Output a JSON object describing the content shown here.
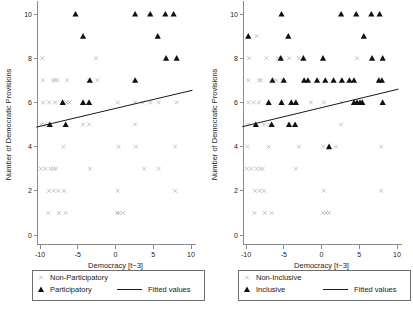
{
  "figure": {
    "background": "#ffffff",
    "width": 413,
    "height": 310,
    "marker_colors": {
      "non_highlight": "#b9b9b9",
      "highlight": "#111111",
      "fit_line": "#1a1a1a",
      "axis": "#8a8a8a"
    }
  },
  "chart_data": [
    {
      "type": "scatter",
      "panel": "left",
      "title": "",
      "xlabel": "Democracy [t−3]",
      "ylabel": "Number of Democratic Provisions",
      "xlim": [
        -11,
        11
      ],
      "ylim": [
        -0.4,
        10.6
      ],
      "xticks": [
        -10,
        -5,
        0,
        5,
        10
      ],
      "xticklabels": [
        "-10",
        "-5",
        "0",
        "5",
        "10"
      ],
      "yticks": [
        0,
        2,
        4,
        6,
        8,
        10
      ],
      "yticklabels": [
        "0",
        "2",
        "4",
        "6",
        "8",
        "10"
      ],
      "grid": false,
      "legend_position": "below-axis",
      "legend": [
        {
          "label": "Non-Participatory",
          "marker": "x",
          "color": "#b9b9b9"
        },
        {
          "label": "Participatory",
          "marker": "triangle",
          "color": "#111111"
        },
        {
          "label": "Fitted values",
          "marker": "line",
          "color": "#1a1a1a"
        }
      ],
      "fitted_line": {
        "x": [
          -10.5,
          10.2
        ],
        "y": [
          4.88,
          6.55
        ]
      },
      "series": [
        {
          "name": "Non-Participatory",
          "marker": "x",
          "color": "#b9b9b9",
          "points": [
            [
              -9.6,
              7
            ],
            [
              -8.3,
              7
            ],
            [
              -8.0,
              7
            ],
            [
              -7.7,
              7
            ],
            [
              -6.4,
              7
            ],
            [
              -3.5,
              7
            ],
            [
              -2.4,
              7
            ],
            [
              -9.6,
              6
            ],
            [
              -8.8,
              6
            ],
            [
              -8.0,
              6
            ],
            [
              -7.0,
              6
            ],
            [
              -6.5,
              6
            ],
            [
              -6.1,
              6
            ],
            [
              0.3,
              6
            ],
            [
              2.6,
              6
            ],
            [
              3.6,
              6
            ],
            [
              4.6,
              6
            ],
            [
              5.7,
              6
            ],
            [
              8.1,
              6
            ],
            [
              -9.8,
              5
            ],
            [
              -9.4,
              5
            ],
            [
              -4.3,
              5
            ],
            [
              -3.5,
              5
            ],
            [
              2.6,
              5
            ],
            [
              -6.9,
              4
            ],
            [
              0.4,
              4
            ],
            [
              2.7,
              4
            ],
            [
              7.9,
              4
            ],
            [
              -9.9,
              3
            ],
            [
              -9.3,
              3
            ],
            [
              -8.6,
              3
            ],
            [
              -8.2,
              3
            ],
            [
              -7.9,
              3
            ],
            [
              -3.4,
              3
            ],
            [
              3.8,
              3
            ],
            [
              5.7,
              3
            ],
            [
              -8.8,
              2
            ],
            [
              -8.2,
              2
            ],
            [
              -7.6,
              2
            ],
            [
              -6.8,
              2
            ],
            [
              0.3,
              2
            ],
            [
              7.9,
              2
            ],
            [
              -8.9,
              1
            ],
            [
              -7.5,
              1
            ],
            [
              -6.6,
              1
            ],
            [
              0.2,
              1
            ],
            [
              0.5,
              1
            ],
            [
              1.0,
              1
            ],
            [
              -2.6,
              8
            ],
            [
              -9.7,
              8
            ]
          ]
        },
        {
          "name": "Participatory",
          "marker": "triangle",
          "color": "#111111",
          "points": [
            [
              -5.3,
              10
            ],
            [
              2.6,
              10
            ],
            [
              4.6,
              10
            ],
            [
              6.6,
              10
            ],
            [
              7.7,
              10
            ],
            [
              -4.3,
              9
            ],
            [
              5.6,
              9
            ],
            [
              6.7,
              8
            ],
            [
              8.1,
              8
            ],
            [
              -3.4,
              7
            ],
            [
              2.6,
              7
            ],
            [
              -7.0,
              6
            ],
            [
              -4.3,
              6
            ],
            [
              -3.5,
              6
            ],
            [
              -8.7,
              5
            ],
            [
              -6.6,
              5
            ]
          ]
        }
      ]
    },
    {
      "type": "scatter",
      "panel": "right",
      "title": "",
      "xlabel": "Democracy [t−3]",
      "ylabel": "Number of Democratic Provisions",
      "xlim": [
        -11,
        11
      ],
      "ylim": [
        -0.4,
        10.6
      ],
      "xticks": [
        -10,
        -5,
        0,
        5,
        10
      ],
      "xticklabels": [
        "-10",
        "-5",
        "0",
        "5",
        "10"
      ],
      "yticks": [
        0,
        2,
        4,
        6,
        8,
        10
      ],
      "yticklabels": [
        "0",
        "2",
        "4",
        "6",
        "8",
        "10"
      ],
      "grid": false,
      "legend_position": "below-axis",
      "legend": [
        {
          "label": "Non-Inclusive",
          "marker": "x",
          "color": "#b9b9b9"
        },
        {
          "label": "Inclusive",
          "marker": "triangle",
          "color": "#111111"
        },
        {
          "label": "Fitted values",
          "marker": "line",
          "color": "#1a1a1a"
        }
      ],
      "fitted_line": {
        "x": [
          -10.5,
          10.2
        ],
        "y": [
          4.9,
          6.6
        ]
      },
      "series": [
        {
          "name": "Non-Inclusive",
          "marker": "x",
          "color": "#b9b9b9",
          "points": [
            [
              -8.6,
              9
            ],
            [
              -9.6,
              8
            ],
            [
              -7.3,
              8
            ],
            [
              -5.8,
              8
            ],
            [
              -5.4,
              8
            ],
            [
              -4.3,
              8
            ],
            [
              -3.0,
              8
            ],
            [
              4.7,
              8
            ],
            [
              -9.7,
              7
            ],
            [
              -8.3,
              7
            ],
            [
              -8.0,
              7
            ],
            [
              -6.0,
              7
            ],
            [
              -5.2,
              7
            ],
            [
              -0.4,
              7
            ],
            [
              -9.7,
              6
            ],
            [
              -9.0,
              6
            ],
            [
              -8.3,
              6
            ],
            [
              -5.2,
              6
            ],
            [
              -1.4,
              6
            ],
            [
              0.3,
              6
            ],
            [
              2.6,
              6
            ],
            [
              4.7,
              6
            ],
            [
              -9.7,
              5
            ],
            [
              -7.6,
              5
            ],
            [
              -6.9,
              5
            ],
            [
              -4.3,
              5
            ],
            [
              2.6,
              5
            ],
            [
              -9.8,
              4
            ],
            [
              -7.0,
              4
            ],
            [
              -3.0,
              4
            ],
            [
              0.2,
              4
            ],
            [
              1.9,
              4
            ],
            [
              7.9,
              4
            ],
            [
              -9.9,
              3
            ],
            [
              -9.3,
              3
            ],
            [
              -8.6,
              3
            ],
            [
              -8.1,
              3
            ],
            [
              -7.8,
              3
            ],
            [
              -3.4,
              3
            ],
            [
              -8.8,
              2
            ],
            [
              -8.2,
              2
            ],
            [
              -7.6,
              2
            ],
            [
              0.3,
              2
            ],
            [
              7.9,
              2
            ],
            [
              -8.9,
              1
            ],
            [
              -7.5,
              1
            ],
            [
              -6.6,
              1
            ],
            [
              0.2,
              1
            ],
            [
              0.6,
              1
            ],
            [
              1.0,
              1
            ]
          ]
        },
        {
          "name": "Inclusive",
          "marker": "triangle",
          "color": "#111111",
          "points": [
            [
              -5.3,
              10
            ],
            [
              2.6,
              10
            ],
            [
              4.6,
              10
            ],
            [
              6.6,
              10
            ],
            [
              7.7,
              10
            ],
            [
              -9.7,
              9
            ],
            [
              -4.4,
              9
            ],
            [
              5.6,
              9
            ],
            [
              -5.4,
              8
            ],
            [
              -2.4,
              8
            ],
            [
              0.2,
              8
            ],
            [
              6.7,
              8
            ],
            [
              8.1,
              8
            ],
            [
              -6.5,
              7
            ],
            [
              -5.0,
              7
            ],
            [
              -2.3,
              7
            ],
            [
              -1.8,
              7
            ],
            [
              -0.6,
              7
            ],
            [
              0.5,
              7
            ],
            [
              1.6,
              7
            ],
            [
              2.7,
              7
            ],
            [
              3.7,
              7
            ],
            [
              4.3,
              7
            ],
            [
              7.6,
              7
            ],
            [
              8.0,
              7
            ],
            [
              -7.0,
              6
            ],
            [
              -5.3,
              6
            ],
            [
              -4.0,
              6
            ],
            [
              -3.4,
              6
            ],
            [
              4.3,
              6
            ],
            [
              4.7,
              6
            ],
            [
              5.1,
              6
            ],
            [
              5.4,
              6
            ],
            [
              8.1,
              6
            ],
            [
              -8.7,
              5
            ],
            [
              -6.6,
              5
            ],
            [
              -4.3,
              5
            ],
            [
              -3.5,
              5
            ],
            [
              1.0,
              4
            ]
          ]
        }
      ]
    }
  ]
}
